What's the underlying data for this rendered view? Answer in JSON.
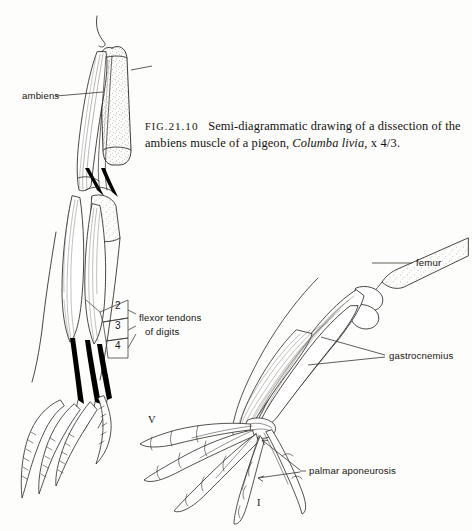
{
  "figure": {
    "caption": {
      "fig_prefix": "Fig.",
      "fig_number": "21.10",
      "text_before_species": "Semi-diagrammatic drawing of a dissection of the ambiens muscle of a pigeon,",
      "species": "Columba livia",
      "magnification": ", x 4/3."
    },
    "labels": {
      "ambiens": "ambiens",
      "femur": "femur",
      "gastrocnemius": "gastrocnemius",
      "palmar_aponeurosis": "palmar aponeurosis",
      "flexor_tendons_line1": "flexor  tendons",
      "flexor_tendons_line2": "of digits"
    },
    "tendon_numbers": [
      "2",
      "3",
      "4"
    ],
    "digit_numerals": {
      "fifth": "V",
      "first": "I"
    },
    "colors": {
      "paper": "#fdfdfb",
      "ink": "#17140f",
      "line": "#2b2722",
      "tendon_black": "#000000",
      "stipple": "#6d6760",
      "leader": "#3a352f"
    }
  }
}
